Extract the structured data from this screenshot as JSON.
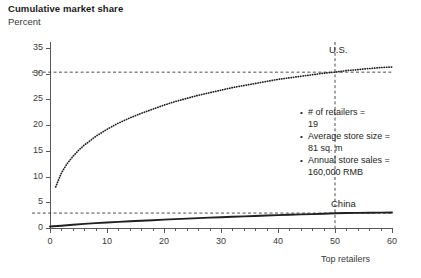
{
  "header": {
    "title": "Cumulative market share",
    "subtitle": "Percent"
  },
  "annotations": {
    "items": [
      {
        "label": "# of retailers =",
        "value": "19"
      },
      {
        "label": "Average store size =",
        "value": "81 sq. m"
      },
      {
        "label": "Annual store sales =",
        "value": "160,000 RMB"
      }
    ]
  },
  "chart_data": {
    "type": "line",
    "title": "Cumulative market share",
    "subtitle": "Percent",
    "xlabel": "Top retailers",
    "ylabel": "Percent",
    "xlim": [
      0,
      60
    ],
    "ylim": [
      0,
      35
    ],
    "xticks": [
      0,
      10,
      20,
      30,
      40,
      50,
      60
    ],
    "xtick_labels": [
      "0",
      "10",
      "20",
      "30",
      "40",
      "50",
      "60"
    ],
    "xminor_step": 2,
    "yticks": [
      0,
      5,
      10,
      15,
      20,
      25,
      30,
      35
    ],
    "ytick_labels": [
      "0",
      "5",
      "10",
      "15",
      "20",
      "25",
      "30",
      "35"
    ],
    "grid": false,
    "legend_position": "inline-labels",
    "reference_lines": [
      {
        "name": "us-level",
        "orientation": "horizontal",
        "value": 30.3,
        "style": "dashed"
      },
      {
        "name": "china-level",
        "orientation": "horizontal",
        "value": 2.9,
        "style": "dashed"
      },
      {
        "name": "top-50-marker",
        "orientation": "vertical",
        "value": 50,
        "style": "dashed"
      }
    ],
    "series": [
      {
        "name": "U.S.",
        "label": "U.S.",
        "style": "dotted",
        "color": "#231f20",
        "x": [
          1,
          2,
          3,
          4,
          5,
          6,
          8,
          10,
          12,
          14,
          16,
          18,
          20,
          22,
          24,
          26,
          28,
          30,
          32,
          34,
          36,
          38,
          40,
          42,
          44,
          46,
          48,
          50,
          52,
          54,
          56,
          58,
          60
        ],
        "values": [
          8.0,
          10.7,
          12.5,
          13.9,
          15.1,
          16.1,
          17.8,
          19.2,
          20.4,
          21.4,
          22.3,
          23.1,
          23.9,
          24.6,
          25.2,
          25.8,
          26.3,
          26.8,
          27.3,
          27.7,
          28.1,
          28.5,
          28.9,
          29.2,
          29.5,
          29.8,
          30.1,
          30.3,
          30.6,
          30.8,
          31.0,
          31.2,
          31.3
        ]
      },
      {
        "name": "China",
        "label": "China",
        "style": "solid",
        "color": "#231f20",
        "x": [
          0,
          2,
          4,
          6,
          8,
          10,
          12,
          14,
          16,
          18,
          20,
          22,
          24,
          26,
          28,
          30,
          32,
          34,
          36,
          38,
          40,
          42,
          44,
          46,
          48,
          50,
          52,
          54,
          56,
          58,
          60
        ],
        "values": [
          0.3,
          0.45,
          0.62,
          0.8,
          0.95,
          1.08,
          1.2,
          1.32,
          1.42,
          1.52,
          1.62,
          1.72,
          1.82,
          1.92,
          2.02,
          2.1,
          2.18,
          2.26,
          2.34,
          2.42,
          2.5,
          2.58,
          2.64,
          2.7,
          2.78,
          2.88,
          2.92,
          2.94,
          2.96,
          2.98,
          3.0
        ]
      }
    ]
  },
  "colors": {
    "axis": "#58595b",
    "text": "#231f20",
    "line": "#231f20",
    "background": "#ffffff"
  }
}
